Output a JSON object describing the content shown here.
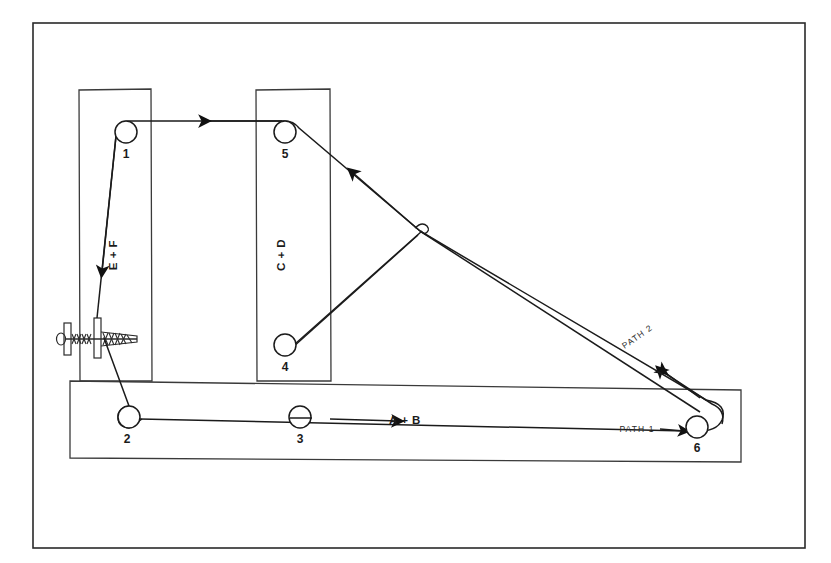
{
  "diagram": {
    "colors": {
      "line": "#1b1b1b",
      "frame": "#2a2a2a",
      "structure": "#3a3a3a",
      "background": "#ffffff"
    },
    "pulleys": [
      {
        "id": "1",
        "label": "1",
        "cx": 126,
        "cy": 132,
        "r": 11
      },
      {
        "id": "2",
        "label": "2",
        "cx": 129,
        "cy": 417,
        "r": 11
      },
      {
        "id": "3",
        "label": "3",
        "cx": 300,
        "cy": 417,
        "r": 11
      },
      {
        "id": "4",
        "label": "4",
        "cx": 285,
        "cy": 345,
        "r": 11
      },
      {
        "id": "5",
        "label": "5",
        "cx": 285,
        "cy": 132,
        "r": 11
      },
      {
        "id": "6",
        "label": "6",
        "cx": 697,
        "cy": 427,
        "r": 11
      }
    ],
    "segment_labels": [
      {
        "id": "ef",
        "text": "E + F",
        "x": 117,
        "y": 255,
        "rotate": -90
      },
      {
        "id": "cd",
        "text": "C + D",
        "x": 285,
        "y": 255,
        "rotate": -90
      },
      {
        "id": "ab",
        "text": "A + B",
        "x": 405,
        "y": 424,
        "rotate": 0
      }
    ],
    "path_labels": [
      {
        "id": "path1",
        "text": "PATH 1",
        "x": 637,
        "y": 432,
        "rotate": 0
      },
      {
        "id": "path2",
        "text": "PATH 2",
        "x": 639,
        "y": 339,
        "rotate": -35
      }
    ]
  }
}
